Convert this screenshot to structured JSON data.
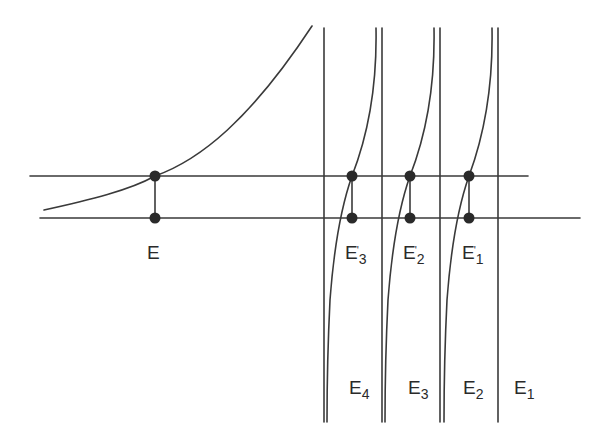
{
  "diagram": {
    "type": "energy-level graphical solution",
    "colors": {
      "line": "#3a3a3a",
      "dot": "#2a2a2a",
      "background": "#ffffff"
    },
    "horizontal_lines": [
      {
        "name": "upper-level-line",
        "y": 176,
        "x1": 30,
        "x2": 528
      },
      {
        "name": "lower-level-line",
        "y": 218,
        "x1": 40,
        "x2": 580
      }
    ],
    "asymptotes": [
      {
        "name": "asymptote-E4",
        "x": 324,
        "label": "E",
        "sub": "4"
      },
      {
        "name": "asymptote-E3",
        "x": 382,
        "label": "E",
        "sub": "3"
      },
      {
        "name": "asymptote-E2",
        "x": 440,
        "label": "E",
        "sub": "2"
      },
      {
        "name": "asymptote-E1",
        "x": 498,
        "label": "E",
        "sub": "1"
      }
    ],
    "points": [
      {
        "name": "E",
        "label": "E",
        "sub": "",
        "prime": false
      },
      {
        "name": "E3-prime",
        "label": "E",
        "sub": "3",
        "prime": true
      },
      {
        "name": "E2-prime",
        "label": "E",
        "sub": "2",
        "prime": true
      },
      {
        "name": "E1-prime",
        "label": "E",
        "sub": "1",
        "prime": true
      }
    ],
    "labels": {
      "E": "E",
      "E3p_base": "E",
      "E3p_sub": "3",
      "E3p_prime": "'",
      "E2p_base": "E",
      "E2p_sub": "2",
      "E2p_prime": "'",
      "E1p_base": "E",
      "E1p_sub": "1",
      "E1p_prime": "'",
      "E4_base": "E",
      "E4_sub": "4",
      "E3_base": "E",
      "E3_sub": "3",
      "E2_base": "E",
      "E2_sub": "2",
      "E1_base": "E",
      "E1_sub": "1"
    }
  }
}
